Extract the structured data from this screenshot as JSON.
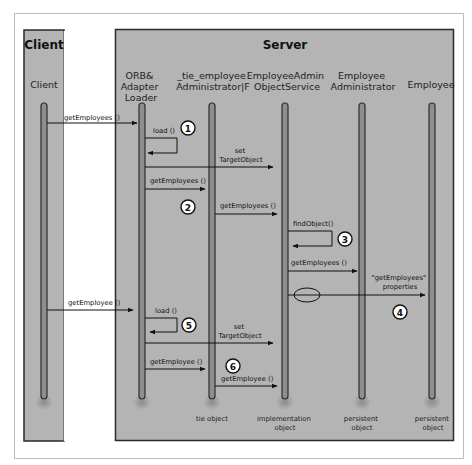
{
  "panels": {
    "client": {
      "title": "Client"
    },
    "server": {
      "title": "Server"
    }
  },
  "lifelines": [
    {
      "id": "client",
      "label_lines": [
        "Client"
      ],
      "footer_lines": []
    },
    {
      "id": "orb",
      "label_lines": [
        "ORB&",
        "Adapter",
        "Loader"
      ],
      "footer_lines": []
    },
    {
      "id": "tie",
      "label_lines": [
        "_tie_employee",
        "Administrator|F"
      ],
      "footer_lines": [
        "tie object"
      ]
    },
    {
      "id": "service",
      "label_lines": [
        "EmployeeAdmin",
        "ObjectService"
      ],
      "footer_lines": [
        "implementation",
        "object"
      ]
    },
    {
      "id": "admin",
      "label_lines": [
        "Employee",
        "Administrator"
      ],
      "footer_lines": [
        "persistent",
        "object"
      ]
    },
    {
      "id": "employee",
      "label_lines": [
        "Employee"
      ],
      "footer_lines": [
        "persistent",
        "object"
      ]
    }
  ],
  "messages": [
    {
      "label": "getEmployees ()",
      "from": "client",
      "to": "orb"
    },
    {
      "label": "load ()",
      "from": "orb",
      "to": "orb",
      "self": true
    },
    {
      "label_lines": [
        "set",
        "TargetObject"
      ],
      "from": "orb",
      "to": "service"
    },
    {
      "label": "getEmployees ()",
      "from": "orb",
      "to": "tie"
    },
    {
      "label": "getEmployees ()",
      "from": "tie",
      "to": "service"
    },
    {
      "label": "findObject()",
      "from": "service",
      "to": "service",
      "self": true
    },
    {
      "label": "getEmployees ()",
      "from": "service",
      "to": "admin"
    },
    {
      "label_lines": [
        "\"getEmployees\"",
        "properties"
      ],
      "from": "service",
      "to": "employee"
    },
    {
      "label": "getEmployee ()",
      "from": "client",
      "to": "orb"
    },
    {
      "label": "load ()",
      "from": "orb",
      "to": "orb",
      "self": true
    },
    {
      "label_lines": [
        "set",
        "TargetObject"
      ],
      "from": "orb",
      "to": "service"
    },
    {
      "label": "getEmployee ()",
      "from": "orb",
      "to": "tie"
    },
    {
      "label": "getEmployee ()",
      "from": "tie",
      "to": "service"
    }
  ],
  "step_markers": [
    "1",
    "2",
    "3",
    "4",
    "5",
    "6"
  ],
  "colors": {
    "panel_fill": "#b4b4b4",
    "panel_border": "#2a2a2a",
    "lifeline": "#3a3a3a",
    "frame": "#bdbdbd",
    "background": "#ffffff"
  }
}
